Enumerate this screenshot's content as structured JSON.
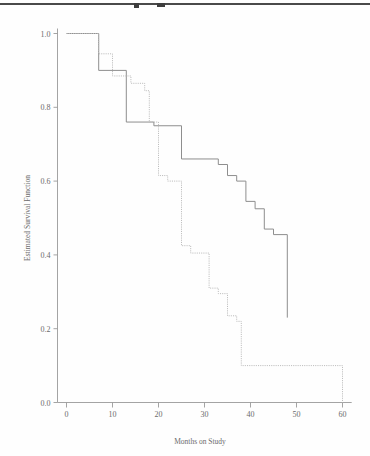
{
  "page": {
    "scan_rule": "horizontal-scan-artifact"
  },
  "chart_data": {
    "type": "line",
    "title": "",
    "xlabel": "Months on Study",
    "ylabel": "Estimated Survival Function",
    "xlim": [
      0,
      62
    ],
    "ylim": [
      0.0,
      1.0
    ],
    "grid": false,
    "legend": "none",
    "xticks": [
      0,
      10,
      20,
      30,
      40,
      50,
      60
    ],
    "xtick_labels": [
      "0",
      "10",
      "20",
      "30",
      "40",
      "50",
      "60"
    ],
    "yticks": [
      0.0,
      0.2,
      0.4,
      0.6,
      0.8,
      1.0
    ],
    "ytick_labels": [
      "0.0",
      "0.2",
      "0.4",
      "0.6",
      "0.8",
      "1.0"
    ],
    "step_style": "post",
    "series": [
      {
        "name": "solid-curve",
        "style": "solid",
        "color": "#8e8e8e",
        "x": [
          0,
          7,
          7,
          13,
          13,
          19,
          19,
          25,
          25,
          33,
          33,
          35,
          35,
          37,
          37,
          39,
          39,
          41,
          41,
          43,
          43,
          45,
          45,
          48,
          48
        ],
        "y": [
          1.0,
          1.0,
          0.9,
          0.9,
          0.76,
          0.76,
          0.75,
          0.75,
          0.66,
          0.66,
          0.645,
          0.645,
          0.615,
          0.615,
          0.6,
          0.6,
          0.545,
          0.545,
          0.525,
          0.525,
          0.47,
          0.47,
          0.455,
          0.455,
          0.23
        ]
      },
      {
        "name": "dotted-curve",
        "style": "dotted",
        "color": "#bdbdbd",
        "x": [
          0,
          7,
          7,
          10,
          10,
          14,
          14,
          17,
          17,
          18,
          18,
          20,
          20,
          22,
          22,
          25,
          25,
          27,
          27,
          31,
          31,
          33,
          33,
          35,
          35,
          37,
          37,
          38,
          38,
          60,
          60
        ],
        "y": [
          1.0,
          1.0,
          0.945,
          0.945,
          0.885,
          0.885,
          0.865,
          0.865,
          0.845,
          0.845,
          0.76,
          0.76,
          0.615,
          0.615,
          0.6,
          0.6,
          0.425,
          0.425,
          0.405,
          0.405,
          0.31,
          0.31,
          0.295,
          0.295,
          0.235,
          0.235,
          0.22,
          0.22,
          0.1,
          0.1,
          0.0
        ]
      }
    ]
  }
}
